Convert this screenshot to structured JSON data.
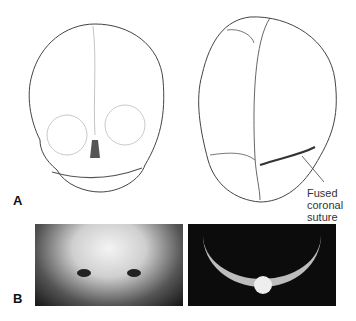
{
  "panels": {
    "a": {
      "label": "A",
      "left_drawing": "Frontal view of infant skull",
      "right_drawing": "Top view of skull showing sutures",
      "annotation": [
        "Fused",
        "coronal",
        "suture"
      ]
    },
    "b": {
      "label": "B",
      "left_photo": "Frontal photo of child's face",
      "right_photo": "Axial view of forehead/skull"
    }
  }
}
